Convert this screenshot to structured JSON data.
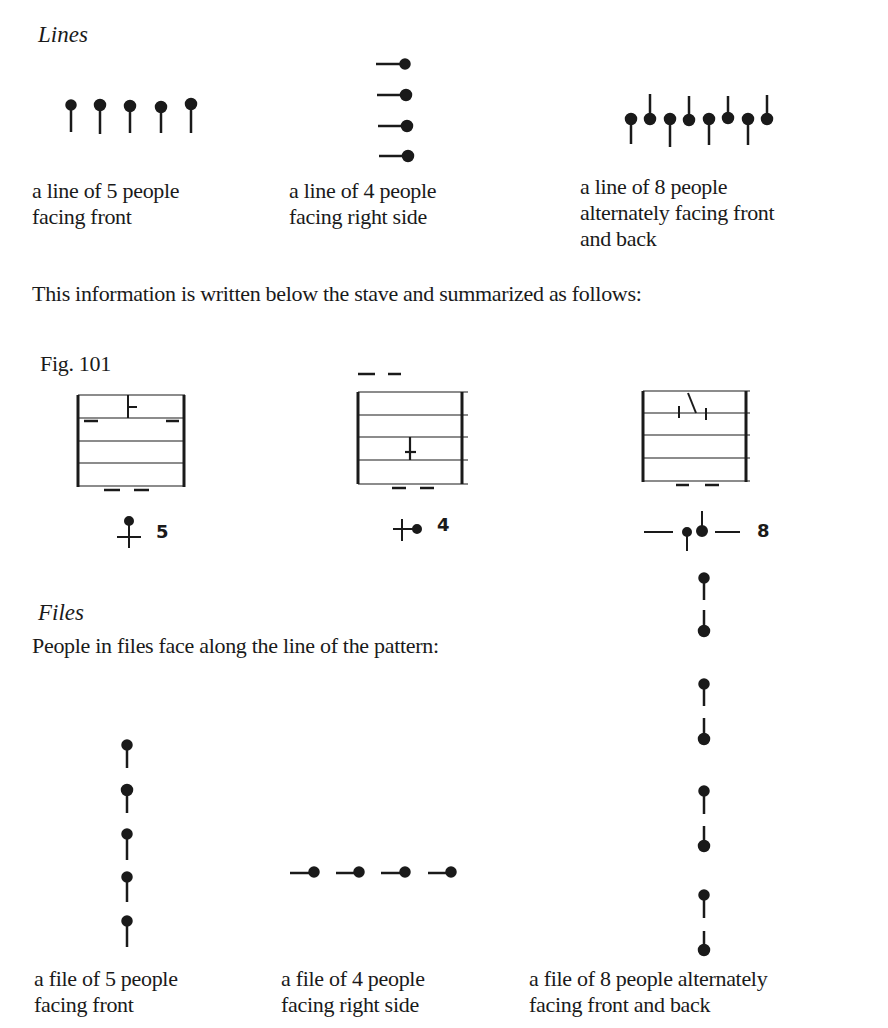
{
  "lines_section": {
    "heading": "Lines",
    "examples": [
      {
        "caption_line1": "a line of 5 people",
        "caption_line2": "facing front",
        "caption_line3": "",
        "count": 5,
        "facing": "front"
      },
      {
        "caption_line1": "a line of 4 people",
        "caption_line2": "facing right side",
        "caption_line3": "",
        "count": 4,
        "facing": "right side"
      },
      {
        "caption_line1": "a line of 8 people",
        "caption_line2": "alternately facing front",
        "caption_line3": "and back",
        "count": 8,
        "facing": "alternately front and back"
      }
    ],
    "summary_text": "This information is written below the stave and summarized as follows:"
  },
  "figure": {
    "label": "Fig. 101",
    "staves": [
      {
        "summary_count": "5"
      },
      {
        "summary_count": "4"
      },
      {
        "summary_count": "8"
      }
    ]
  },
  "files_section": {
    "heading": "Files",
    "intro_text": "People in files face along the line of the pattern:",
    "examples": [
      {
        "caption_line1": "a file of 5 people",
        "caption_line2": "facing front",
        "count": 5,
        "facing": "front"
      },
      {
        "caption_line1": "a file of 4 people",
        "caption_line2": "facing right side",
        "count": 4,
        "facing": "right side"
      },
      {
        "caption_line1": "a file of 8 people alternately",
        "caption_line2": "facing front and back",
        "count": 8,
        "facing": "alternately front and back"
      }
    ]
  },
  "colors": {
    "ink": "#1a1a1a",
    "paper": "#ffffff"
  }
}
